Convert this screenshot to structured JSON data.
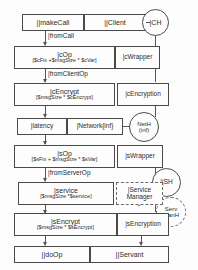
{
  "diagram": {
    "type": "lqn-task-entry-diagram"
  },
  "nodes": {
    "makeCall": {
      "label": "||makeCall"
    },
    "client": {
      "label": "||Client"
    },
    "ch": {
      "label": "|CH"
    },
    "cOp": {
      "label": "|cOp",
      "demand": "[$cFix +$msgSize * $cVar]"
    },
    "cWrapper": {
      "label": "|cWrapper"
    },
    "cEncrypt": {
      "label": "|cEncrypt",
      "demand": "[$msgSize * $cEncrypt]"
    },
    "cEncryption": {
      "label": "|cEncryption"
    },
    "latency": {
      "label": "|latency"
    },
    "network": {
      "label": "|Network{inf}"
    },
    "netH": {
      "label": "NetH",
      "sub": "(inf)"
    },
    "sOp": {
      "label": "|sOp",
      "demand": "[$sFix + $msgSize * $sVar]"
    },
    "sWrapper": {
      "label": "|sWrapper"
    },
    "service": {
      "label": "|service",
      "demand": "[$msgSize *$service]"
    },
    "serviceMgr": {
      "label": "|Service",
      "line2": "Manager"
    },
    "sh": {
      "label": "||SH"
    },
    "servManH": {
      "label": "Serv",
      "line2": "ManH"
    },
    "sEncrypt": {
      "label": "|sEncrypt",
      "demand": "[$msgSize * $sEncrypt]"
    },
    "sEncryption": {
      "label": "|sEncryption"
    },
    "doOp": {
      "label": "||doOp"
    },
    "servant": {
      "label": "||Servant"
    }
  },
  "edges": {
    "fromCall": {
      "label": "|fromCall"
    },
    "fromClientOp": {
      "label": "|fromClientOp"
    },
    "fromServerOp": {
      "label": "|fromServerOp"
    }
  },
  "colors": {
    "stroke": "#4a4a4a",
    "dashed_stroke": "#6a6a6a",
    "text": "#2b2b2b",
    "background": "#fdfdfd"
  }
}
